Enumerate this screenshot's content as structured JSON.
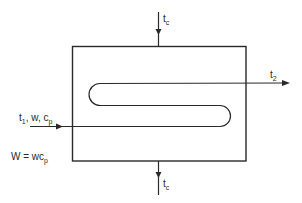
{
  "diagram": {
    "type": "heat-exchanger-schematic",
    "colors": {
      "line": "#2a2a2a",
      "background": "#ffffff"
    },
    "labels": {
      "coolant_in": {
        "main": "t",
        "sub": "c"
      },
      "coolant_out": {
        "main": "t",
        "sub": "c"
      },
      "outlet": {
        "main": "t",
        "sub": "2"
      },
      "inlet": {
        "t": "t",
        "t_sub": "1",
        "sep1": ", w, ",
        "c": "c",
        "c_sub": "p"
      },
      "equation": {
        "lhs": "W = wc",
        "sub": "p"
      }
    }
  }
}
